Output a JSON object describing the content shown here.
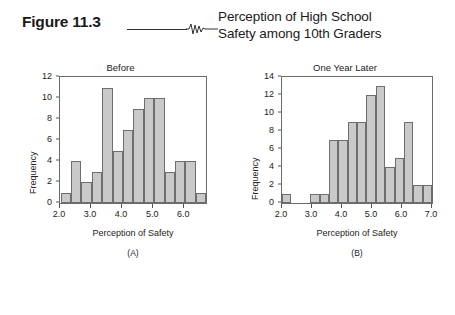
{
  "figure": {
    "label": "Figure 11.3",
    "title": "Perception of High School\nSafety among 10th Graders",
    "rule_icon": "horizontal-rule",
    "squiggle_icon": "squiggle-line-icon"
  },
  "chart_data": [
    {
      "type": "bar",
      "panel_letter": "(A)",
      "title": "Before",
      "xlabel": "Perception of Safety",
      "ylabel": "Frequency",
      "grid": false,
      "legend": "none",
      "xlim": [
        2.0,
        6.7
      ],
      "ylim": [
        0,
        12
      ],
      "bin_width": 0.335,
      "xticks": [
        2.0,
        3.0,
        4.0,
        5.0,
        6.0
      ],
      "xticklabels": [
        "2.0",
        "3.0",
        "4.0",
        "5.0",
        "6.0"
      ],
      "yticks": [
        0,
        2,
        4,
        6,
        8,
        10,
        12
      ],
      "yticklabels": [
        "0",
        "2",
        "4",
        "6",
        "8",
        "10",
        "12"
      ],
      "bin_starts": [
        2.02,
        2.355,
        2.69,
        3.025,
        3.36,
        3.695,
        4.03,
        4.365,
        4.7,
        5.035,
        5.37,
        5.705,
        6.04,
        6.375
      ],
      "values": [
        1,
        4,
        2,
        3,
        11,
        5,
        7,
        9,
        10,
        10,
        3,
        4,
        4,
        1
      ]
    },
    {
      "type": "bar",
      "panel_letter": "(B)",
      "title": "One Year Later",
      "xlabel": "Perception of Safety",
      "ylabel": "Frequency",
      "grid": false,
      "legend": "none",
      "xlim": [
        2.0,
        7.0
      ],
      "ylim": [
        0,
        14
      ],
      "bin_width": 0.3125,
      "xticks": [
        2.0,
        3.0,
        4.0,
        5.0,
        6.0,
        7.0
      ],
      "xticklabels": [
        "2.0",
        "3.0",
        "4.0",
        "5.0",
        "6.0",
        "7.0"
      ],
      "yticks": [
        0,
        2,
        4,
        6,
        8,
        10,
        12,
        14
      ],
      "yticklabels": [
        "0",
        "2",
        "4",
        "6",
        "8",
        "10",
        "12",
        "14"
      ],
      "bin_starts": [
        2.0,
        2.3125,
        2.625,
        2.9375,
        3.25,
        3.5625,
        3.875,
        4.1875,
        4.5,
        4.8125,
        5.125,
        5.4375,
        5.75,
        6.0625,
        6.375,
        6.6875
      ],
      "values": [
        1,
        0,
        0,
        1,
        1,
        7,
        7,
        9,
        9,
        12,
        13,
        4,
        5,
        9,
        2,
        2
      ]
    }
  ],
  "colors": {
    "bar_fill": "#c9c9c9",
    "bar_border": "#6e6e6e",
    "axis": "#6b6b6b",
    "text": "#1a1a1a",
    "background": "#ffffff"
  }
}
